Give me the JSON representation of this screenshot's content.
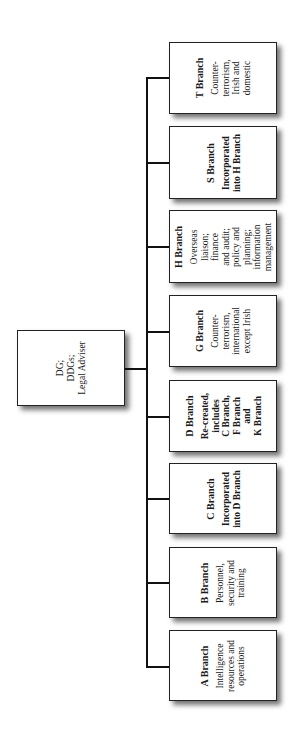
{
  "root": {
    "lines": [
      "DG;",
      "DDGs;",
      "Legal Adviser"
    ]
  },
  "branches": [
    {
      "title": "A Branch",
      "lines": [
        "Intelligence",
        "resources and",
        "operations"
      ],
      "bold_desc": false
    },
    {
      "title": "B Branch",
      "lines": [
        "Personnel,",
        "security and",
        "training"
      ],
      "bold_desc": false
    },
    {
      "title": "C Branch",
      "lines": [
        "Incorporated",
        "into D Branch"
      ],
      "bold_desc": true
    },
    {
      "title": "D Branch",
      "lines": [
        "Re-created,",
        "includes",
        "C Branch,",
        "F Branch",
        "and",
        "K Branch"
      ],
      "bold_desc": true
    },
    {
      "title": "G Branch",
      "lines": [
        "Counter-",
        "terrorism,",
        "international",
        "except Irish"
      ],
      "bold_desc": false
    },
    {
      "title": "H Branch",
      "lines": [
        "Overseas",
        "liaison;",
        "finance",
        "and audit;",
        "policy and",
        "planning;",
        "information",
        "management"
      ],
      "bold_desc": false
    },
    {
      "title": "S Branch",
      "lines": [
        "Incorporated",
        "into H Branch"
      ],
      "bold_desc": true
    },
    {
      "title": "T Branch",
      "lines": [
        "Counter-",
        "terrorism,",
        "Irish and",
        "domestic"
      ],
      "bold_desc": false
    }
  ],
  "colors": {
    "line": "#111111",
    "box_border": "#222222",
    "background": "#ffffff"
  }
}
